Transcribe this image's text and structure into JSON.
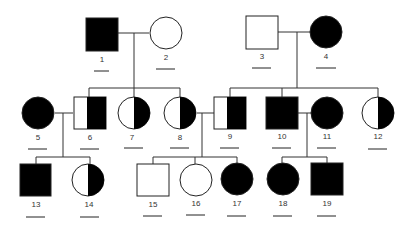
{
  "diagram": {
    "type": "pedigree",
    "legend": {
      "square": "male",
      "circle": "female",
      "filled": "affected",
      "half_filled": "carrier",
      "unfilled": "unaffected"
    },
    "colors": {
      "stroke": "#222222",
      "fill": "#000000",
      "background": "#ffffff"
    },
    "individuals": [
      {
        "id": "1",
        "label": "1",
        "sex": "male",
        "status": "affected",
        "generation": 1
      },
      {
        "id": "2",
        "label": "2",
        "sex": "female",
        "status": "unaffected",
        "generation": 1
      },
      {
        "id": "3",
        "label": "3",
        "sex": "male",
        "status": "unaffected",
        "generation": 1
      },
      {
        "id": "4",
        "label": "4",
        "sex": "female",
        "status": "affected",
        "generation": 1
      },
      {
        "id": "5",
        "label": "5",
        "sex": "female",
        "status": "affected",
        "generation": 2
      },
      {
        "id": "6",
        "label": "6",
        "sex": "male",
        "status": "carrier",
        "generation": 2
      },
      {
        "id": "7",
        "label": "7",
        "sex": "female",
        "status": "carrier",
        "generation": 2
      },
      {
        "id": "8",
        "label": "8",
        "sex": "female",
        "status": "carrier",
        "generation": 2
      },
      {
        "id": "9",
        "label": "9",
        "sex": "male",
        "status": "carrier",
        "generation": 2
      },
      {
        "id": "10",
        "label": "10",
        "sex": "male",
        "status": "affected",
        "generation": 2
      },
      {
        "id": "11",
        "label": "11",
        "sex": "female",
        "status": "affected",
        "generation": 2
      },
      {
        "id": "12",
        "label": "12",
        "sex": "female",
        "status": "carrier",
        "generation": 2
      },
      {
        "id": "13",
        "label": "13",
        "sex": "male",
        "status": "affected",
        "generation": 3
      },
      {
        "id": "14",
        "label": "14",
        "sex": "female",
        "status": "carrier",
        "generation": 3
      },
      {
        "id": "15",
        "label": "15",
        "sex": "male",
        "status": "unaffected",
        "generation": 3
      },
      {
        "id": "16",
        "label": "16",
        "sex": "female",
        "status": "unaffected",
        "generation": 3
      },
      {
        "id": "17",
        "label": "17",
        "sex": "female",
        "status": "affected",
        "generation": 3
      },
      {
        "id": "18",
        "label": "18",
        "sex": "female",
        "status": "affected",
        "generation": 3
      },
      {
        "id": "19",
        "label": "19",
        "sex": "male",
        "status": "affected",
        "generation": 3
      }
    ],
    "matings": [
      {
        "partners": [
          "1",
          "2"
        ],
        "children": [
          "6",
          "7",
          "8"
        ]
      },
      {
        "partners": [
          "3",
          "4"
        ],
        "children": [
          "9",
          "10",
          "11",
          "12"
        ]
      },
      {
        "partners": [
          "5",
          "6"
        ],
        "children": [
          "13",
          "14"
        ]
      },
      {
        "partners": [
          "8",
          "9"
        ],
        "children": [
          "15",
          "16",
          "17"
        ]
      },
      {
        "partners": [
          "10",
          "11"
        ],
        "children": [
          "18",
          "19"
        ]
      }
    ],
    "answer_blanks": "blank underline beneath each individual label"
  }
}
